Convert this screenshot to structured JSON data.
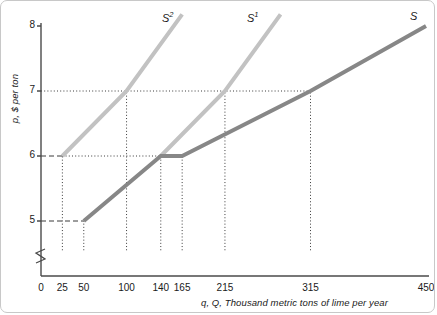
{
  "chart_data": {
    "type": "line",
    "title": "",
    "xlabel": "q, Q, Thousand metric tons of lime per year",
    "ylabel": "p, $ per ton",
    "xlim": [
      0,
      450
    ],
    "ylim": [
      4.55,
      8.35
    ],
    "grid": false,
    "legend_position": "inline-curve-labels",
    "axis_break": {
      "axis": "y",
      "symbol": "zigzag",
      "note": "y-axis broken below 5"
    },
    "xticks": [
      {
        "value": 0,
        "label": "0"
      },
      {
        "value": 25,
        "label": "25"
      },
      {
        "value": 50,
        "label": "50"
      },
      {
        "value": 100,
        "label": "100"
      },
      {
        "value": 140,
        "label": "140"
      },
      {
        "value": 165,
        "label": "165"
      },
      {
        "value": 215,
        "label": "215"
      },
      {
        "value": 315,
        "label": "315"
      },
      {
        "value": 450,
        "label": "450"
      }
    ],
    "yticks": [
      {
        "value": 5,
        "label": "5"
      },
      {
        "value": 6,
        "label": "6"
      },
      {
        "value": 7,
        "label": "7"
      },
      {
        "value": 8,
        "label": "8"
      }
    ],
    "series": [
      {
        "name": "S2",
        "label": "S",
        "superscript": "2",
        "color": "#c2c2c2",
        "width": 4,
        "points": [
          [
            25,
            6
          ],
          [
            100,
            7
          ],
          [
            165,
            8.18
          ]
        ]
      },
      {
        "name": "S1",
        "label": "S",
        "superscript": "1",
        "color": "#c2c2c2",
        "width": 4,
        "points": [
          [
            140,
            6
          ],
          [
            215,
            7
          ],
          [
            280,
            8.18
          ]
        ]
      },
      {
        "name": "S",
        "label": "S",
        "superscript": "",
        "color": "#878787",
        "width": 4,
        "points": [
          [
            50,
            5
          ],
          [
            140,
            6
          ],
          [
            165,
            6
          ],
          [
            315,
            7
          ],
          [
            450,
            8
          ]
        ]
      }
    ],
    "guides": [
      {
        "type": "dashed-horizontal",
        "y": 5,
        "from_x": 0,
        "to_x": 50
      },
      {
        "type": "dashed-horizontal",
        "y": 6,
        "from_x": 0,
        "to_x": 25
      },
      {
        "type": "dotted-horizontal",
        "y": 6,
        "from_x": 25,
        "to_x": 140
      },
      {
        "type": "dotted-horizontal",
        "y": 7,
        "from_x": 0,
        "to_x": 315
      },
      {
        "type": "dotted-vertical",
        "x": 25,
        "from_y": 4.55,
        "to_y": 6
      },
      {
        "type": "dotted-vertical",
        "x": 50,
        "from_y": 4.55,
        "to_y": 5
      },
      {
        "type": "dotted-vertical",
        "x": 100,
        "from_y": 4.55,
        "to_y": 7
      },
      {
        "type": "dotted-vertical",
        "x": 140,
        "from_y": 4.55,
        "to_y": 6
      },
      {
        "type": "dotted-vertical",
        "x": 165,
        "from_y": 4.55,
        "to_y": 6
      },
      {
        "type": "dotted-vertical",
        "x": 215,
        "from_y": 4.55,
        "to_y": 7
      },
      {
        "type": "dotted-vertical",
        "x": 315,
        "from_y": 4.55,
        "to_y": 7
      }
    ],
    "annotations": [
      {
        "text": "S2",
        "x": 160,
        "y": 8.25
      },
      {
        "text": "S1",
        "x": 250,
        "y": 8.25
      },
      {
        "text": "S",
        "x": 448,
        "y": 8.25
      }
    ]
  },
  "curve_labels": {
    "s2_base": "S",
    "s2_sup": "2",
    "s1_base": "S",
    "s1_sup": "1",
    "s_base": "S"
  },
  "axis_titles": {
    "x": "q, Q, Thousand metric tons of lime per year",
    "y": "p, $ per ton"
  }
}
